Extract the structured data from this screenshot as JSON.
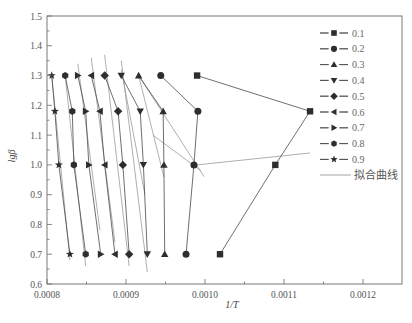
{
  "chart_data": {
    "type": "scatter",
    "title": "",
    "xlabel": "1/T",
    "ylabel": "lgβ",
    "xlim": [
      0.0008,
      0.00125
    ],
    "ylim": [
      0.6,
      1.5
    ],
    "x_ticks": [
      "0.0008",
      "0.0009",
      "0.0010",
      "0.0011",
      "0.0012"
    ],
    "y_ticks": [
      "0.6",
      "0.7",
      "0.8",
      "0.9",
      "1.0",
      "1.1",
      "1.2",
      "1.3",
      "1.4",
      "1.5"
    ],
    "grid": false,
    "legend_position": "upper right (inside)",
    "y_levels": [
      1.3,
      1.18,
      1.0,
      0.7
    ],
    "series": [
      {
        "name": "0.1",
        "marker": "square",
        "x": [
          0.00099,
          0.001133,
          0.001089,
          0.001019
        ],
        "y": [
          1.3,
          1.18,
          1.0,
          0.7
        ]
      },
      {
        "name": "0.2",
        "marker": "circle",
        "x": [
          0.000944,
          0.000991,
          0.000986,
          0.000976
        ],
        "y": [
          1.3,
          1.18,
          1.0,
          0.7
        ]
      },
      {
        "name": "0.3",
        "marker": "triangle-up",
        "x": [
          0.000916,
          0.000947,
          0.000948,
          0.000949
        ],
        "y": [
          1.3,
          1.18,
          1.0,
          0.7
        ]
      },
      {
        "name": "0.4",
        "marker": "triangle-down",
        "x": [
          0.000894,
          0.000918,
          0.000922,
          0.000927
        ],
        "y": [
          1.3,
          1.18,
          1.0,
          0.7
        ]
      },
      {
        "name": "0.5",
        "marker": "diamond",
        "x": [
          0.000873,
          0.00089,
          0.000896,
          0.000904
        ],
        "y": [
          1.3,
          1.18,
          1.0,
          0.7
        ]
      },
      {
        "name": "0.6",
        "marker": "triangle-left",
        "x": [
          0.000856,
          0.000867,
          0.000873,
          0.000886
        ],
        "y": [
          1.3,
          1.18,
          1.0,
          0.7
        ]
      },
      {
        "name": "0.7",
        "marker": "triangle-right",
        "x": [
          0.000839,
          0.000849,
          0.000853,
          0.000868
        ],
        "y": [
          1.3,
          1.18,
          1.0,
          0.7
        ]
      },
      {
        "name": "0.8",
        "marker": "hexagon",
        "x": [
          0.000823,
          0.000832,
          0.000834,
          0.000849
        ],
        "y": [
          1.3,
          1.18,
          1.0,
          0.7
        ]
      },
      {
        "name": "0.9",
        "marker": "star",
        "x": [
          0.000806,
          0.00081,
          0.000815,
          0.000829
        ],
        "y": [
          1.3,
          1.18,
          1.0,
          0.7
        ]
      }
    ],
    "fit_lines": [
      {
        "name": "拟合曲线",
        "x": [
          0.00099,
          0.001133
        ],
        "y": [
          1.0,
          1.04
        ]
      },
      {
        "name": "拟合曲线",
        "x": [
          0.000934,
          0.000995
        ],
        "y": [
          1.1,
          0.98
        ]
      },
      {
        "name": "拟合曲线",
        "x": [
          0.000916,
          0.000999
        ],
        "y": [
          1.3,
          0.96
        ]
      },
      {
        "name": "拟合曲线",
        "x": [
          0.000916,
          0.000948
        ],
        "y": [
          1.3,
          0.96
        ]
      },
      {
        "name": "拟合曲线",
        "x": [
          0.000894,
          0.000927
        ],
        "y": [
          1.35,
          0.64
        ]
      },
      {
        "name": "拟合曲线",
        "x": [
          0.000894,
          0.000924
        ],
        "y": [
          1.32,
          0.9
        ]
      },
      {
        "name": "拟合曲线",
        "x": [
          0.000873,
          0.000904
        ],
        "y": [
          1.37,
          0.66
        ]
      },
      {
        "name": "拟合曲线",
        "x": [
          0.000856,
          0.000886
        ],
        "y": [
          1.36,
          0.74
        ]
      },
      {
        "name": "拟合曲线",
        "x": [
          0.000839,
          0.000867
        ],
        "y": [
          1.34,
          0.78
        ]
      },
      {
        "name": "拟合曲线",
        "x": [
          0.000823,
          0.000849
        ],
        "y": [
          1.3,
          0.66
        ]
      },
      {
        "name": "拟合曲线",
        "x": [
          0.000806,
          0.000829
        ],
        "y": [
          1.3,
          0.68
        ]
      }
    ]
  },
  "legend": {
    "items": [
      {
        "label": "0.1",
        "marker": "square"
      },
      {
        "label": "0.2",
        "marker": "circle"
      },
      {
        "label": "0.3",
        "marker": "triangle-up"
      },
      {
        "label": "0.4",
        "marker": "triangle-down"
      },
      {
        "label": "0.5",
        "marker": "diamond"
      },
      {
        "label": "0.6",
        "marker": "triangle-left"
      },
      {
        "label": "0.7",
        "marker": "triangle-right"
      },
      {
        "label": "0.8",
        "marker": "hexagon"
      },
      {
        "label": "0.9",
        "marker": "star"
      }
    ],
    "fit_label": "拟合曲线"
  },
  "colors": {
    "axis": "#6a6a6a",
    "marker": "#2e2e2e",
    "connect_line": "#4a4a4a",
    "fit_line": "#9a9a9a"
  }
}
